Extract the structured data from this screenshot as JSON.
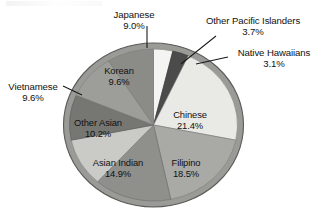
{
  "chart_data": {
    "type": "pie",
    "title": "",
    "subtitle": "",
    "xlabel": "",
    "ylabel": "",
    "legend_position": "none",
    "grid": false,
    "label_format": "name + percent",
    "start_angle_deg": 0,
    "direction": "clockwise",
    "categories": [
      "Other Pacific Islanders",
      "Native Hawaiians",
      "Chinese",
      "Filipino",
      "Asian Indian",
      "Other Asian",
      "Vietnamese",
      "Korean",
      "Japanese"
    ],
    "values": [
      3.7,
      3.1,
      21.4,
      18.5,
      14.9,
      10.2,
      9.6,
      9.6,
      9.0
    ],
    "units": "percent",
    "slices": [
      {
        "label": "Other Pacific Islanders",
        "percent": 3.7,
        "percent_text": "3.7%",
        "color": "#f4f4f2",
        "label_placement": "outside-top-right"
      },
      {
        "label": "Native Hawaiians",
        "percent": 3.1,
        "percent_text": "3.1%",
        "color": "#4b4b4b",
        "label_placement": "outside-right"
      },
      {
        "label": "Chinese",
        "percent": 21.4,
        "percent_text": "21.4%",
        "color": "#e9e9e6",
        "label_placement": "inside"
      },
      {
        "label": "Filipino",
        "percent": 18.5,
        "percent_text": "18.5%",
        "color": "#a9a9a6",
        "label_placement": "inside"
      },
      {
        "label": "Asian Indian",
        "percent": 14.9,
        "percent_text": "14.9%",
        "color": "#8f8f8c",
        "label_placement": "inside"
      },
      {
        "label": "Other Asian",
        "percent": 10.2,
        "percent_text": "10.2%",
        "color": "#cacac7",
        "label_placement": "inside"
      },
      {
        "label": "Vietnamese",
        "percent": 9.6,
        "percent_text": "9.6%",
        "color": "#767673",
        "label_placement": "outside-left"
      },
      {
        "label": "Korean",
        "percent": 9.6,
        "percent_text": "9.6%",
        "color": "#9d9d9a",
        "label_placement": "inside"
      },
      {
        "label": "Japanese",
        "percent": 9.0,
        "percent_text": "9.0%",
        "color": "#8b8b88",
        "label_placement": "outside-top"
      }
    ]
  },
  "labels": {
    "japanese": {
      "name": "Japanese",
      "percent": "9.0%"
    },
    "pacific": {
      "name": "Other Pacific Islanders",
      "percent": "3.7%"
    },
    "hawaiian": {
      "name": "Native Hawaiians",
      "percent": "3.1%"
    },
    "vietnamese": {
      "name": "Vietnamese",
      "percent": "9.6%"
    },
    "korean": {
      "name": "Korean",
      "percent": "9.6%"
    },
    "other_asian": {
      "name": "Other Asian",
      "percent": "10.2%"
    },
    "asian_indian": {
      "name": "Asian Indian",
      "percent": "14.9%"
    },
    "filipino": {
      "name": "Filipino",
      "percent": "18.5%"
    },
    "chinese": {
      "name": "Chinese",
      "percent": "21.4%"
    }
  },
  "colors": {
    "background": "#ffffff",
    "text": "#111111",
    "leader_line": "#1a1a1a",
    "pie_outline": "#5a5a58",
    "pie_rim": "#9a9a97"
  }
}
